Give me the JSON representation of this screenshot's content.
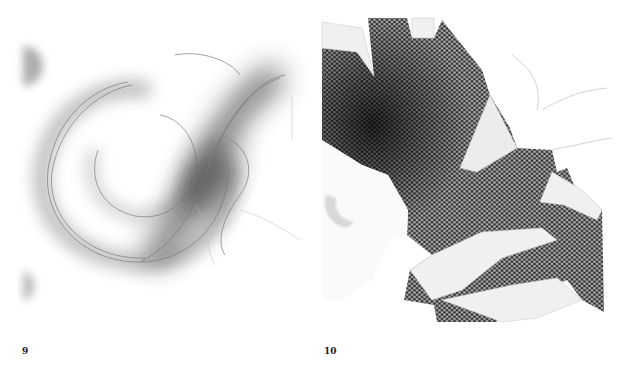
{
  "page": {
    "background": "#ffffff"
  },
  "plates": [
    {
      "number": "9",
      "description": "blurred grey script calligraphic letter flourish (S/J-like swash) on white paper",
      "tones": {
        "stroke": "#6e6e6e",
        "shadow": "#3a3a3a",
        "paper": "#ffffff"
      }
    },
    {
      "number": "10",
      "description": "torn paper collage revealing dark hexagonal mesh texture beneath white paper layers",
      "tones": {
        "mesh_dark": "#1c1c1c",
        "mesh_light": "#9a9a9a",
        "paper": "#f2f2f2"
      }
    }
  ]
}
